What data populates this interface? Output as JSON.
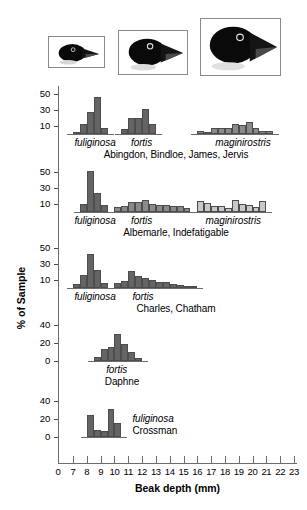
{
  "figure": {
    "y_axis_caption": "% of Sample",
    "x_axis_caption": "Beak depth (mm)",
    "x_tick_labels": [
      "0",
      "7",
      "8",
      "9",
      "10",
      "11",
      "12",
      "13",
      "14",
      "15",
      "16",
      "17",
      "18",
      "19",
      "20",
      "21",
      "22",
      "23"
    ],
    "bird_images": [
      {
        "name": "small-ground-finch-head",
        "alt": "Geospiza fuliginosa head"
      },
      {
        "name": "medium-ground-finch-head",
        "alt": "Geospiza fortis head"
      },
      {
        "name": "large-ground-finch-head",
        "alt": "Geospiza magnirostris head"
      }
    ]
  },
  "chart_data": {
    "type": "bar",
    "title": "",
    "xlabel": "Beak depth (mm)",
    "ylabel": "% of Sample",
    "xlim": [
      6.0,
      23.5
    ],
    "grid": false,
    "legend": false,
    "note": "Five stacked histogram panels of Galapagos ground finch beak depth by island group. Bin width 0.5 mm; x values are bin left edges.",
    "panels": [
      {
        "island": "Abingdon, Bindloe, James, Jervis",
        "ylim": [
          0,
          58
        ],
        "yticks": [
          10,
          30,
          50
        ],
        "species": [
          {
            "name": "fuliginosa",
            "label_x": 7.1,
            "shade": "dark",
            "bins": [
              {
                "x": 7.0,
                "v": 3
              },
              {
                "x": 7.5,
                "v": 13
              },
              {
                "x": 8.0,
                "v": 28
              },
              {
                "x": 8.5,
                "v": 47
              },
              {
                "x": 9.0,
                "v": 8
              }
            ]
          },
          {
            "name": "fortis",
            "label_x": 11.2,
            "shade": "dark",
            "bins": [
              {
                "x": 10.5,
                "v": 6
              },
              {
                "x": 11.0,
                "v": 20
              },
              {
                "x": 11.5,
                "v": 20
              },
              {
                "x": 12.0,
                "v": 31
              },
              {
                "x": 12.5,
                "v": 12
              }
            ]
          },
          {
            "name": "maginirostris",
            "label_x": 17.3,
            "shade": "mid",
            "bins": [
              {
                "x": 16.0,
                "v": 4
              },
              {
                "x": 16.5,
                "v": 2
              },
              {
                "x": 17.0,
                "v": 7
              },
              {
                "x": 17.5,
                "v": 8
              },
              {
                "x": 18.0,
                "v": 8
              },
              {
                "x": 18.5,
                "v": 12
              },
              {
                "x": 19.0,
                "v": 11
              },
              {
                "x": 19.5,
                "v": 15
              },
              {
                "x": 20.0,
                "v": 7
              },
              {
                "x": 20.5,
                "v": 4
              },
              {
                "x": 21.0,
                "v": 4
              }
            ]
          }
        ]
      },
      {
        "island": "Albemarle, Indefatigable",
        "ylim": [
          0,
          58
        ],
        "yticks": [
          10,
          30,
          50
        ],
        "species": [
          {
            "name": "fuliginosa",
            "label_x": 7.1,
            "shade": "dark",
            "bins": [
              {
                "x": 7.5,
                "v": 10
              },
              {
                "x": 8.0,
                "v": 52
              },
              {
                "x": 8.5,
                "v": 24
              },
              {
                "x": 9.0,
                "v": 9
              }
            ]
          },
          {
            "name": "fortis",
            "label_x": 11.2,
            "shade": "mid",
            "bins": [
              {
                "x": 10.0,
                "v": 6
              },
              {
                "x": 10.5,
                "v": 8
              },
              {
                "x": 11.0,
                "v": 12
              },
              {
                "x": 11.5,
                "v": 12
              },
              {
                "x": 12.0,
                "v": 15
              },
              {
                "x": 12.5,
                "v": 10
              },
              {
                "x": 13.0,
                "v": 9
              },
              {
                "x": 13.5,
                "v": 9
              },
              {
                "x": 14.0,
                "v": 7
              },
              {
                "x": 14.5,
                "v": 7
              },
              {
                "x": 15.0,
                "v": 5
              }
            ]
          },
          {
            "name": "maginirostris",
            "label_x": 16.6,
            "shade": "light",
            "bins": [
              {
                "x": 16.0,
                "v": 14
              },
              {
                "x": 16.5,
                "v": 11
              },
              {
                "x": 17.0,
                "v": 7
              },
              {
                "x": 17.5,
                "v": 8
              },
              {
                "x": 18.0,
                "v": 5
              },
              {
                "x": 18.5,
                "v": 15
              },
              {
                "x": 19.0,
                "v": 10
              },
              {
                "x": 19.5,
                "v": 9
              },
              {
                "x": 20.0,
                "v": 6
              },
              {
                "x": 20.5,
                "v": 14
              }
            ]
          }
        ]
      },
      {
        "island": "Charles, Chatham",
        "ylim": [
          0,
          58
        ],
        "yticks": [
          10,
          30,
          50
        ],
        "species": [
          {
            "name": "fuliginosa",
            "label_x": 7.1,
            "shade": "dark",
            "bins": [
              {
                "x": 7.0,
                "v": 5
              },
              {
                "x": 7.5,
                "v": 16
              },
              {
                "x": 8.0,
                "v": 43
              },
              {
                "x": 8.5,
                "v": 23
              },
              {
                "x": 9.0,
                "v": 6
              }
            ]
          },
          {
            "name": "fortis",
            "label_x": 11.3,
            "shade": "dark",
            "bins": [
              {
                "x": 10.0,
                "v": 6
              },
              {
                "x": 10.5,
                "v": 9
              },
              {
                "x": 11.0,
                "v": 22
              },
              {
                "x": 11.5,
                "v": 15
              },
              {
                "x": 12.0,
                "v": 12
              },
              {
                "x": 12.5,
                "v": 10
              },
              {
                "x": 13.0,
                "v": 8
              },
              {
                "x": 13.5,
                "v": 7
              },
              {
                "x": 14.0,
                "v": 5
              },
              {
                "x": 14.5,
                "v": 4
              },
              {
                "x": 15.0,
                "v": 2
              },
              {
                "x": 15.5,
                "v": 2
              }
            ]
          }
        ]
      },
      {
        "island": "Daphne",
        "ylim": [
          0,
          45
        ],
        "yticks": [
          0,
          20,
          40
        ],
        "species": [
          {
            "name": "fortis",
            "label_x": 9.4,
            "shade": "dark",
            "bins": [
              {
                "x": 8.5,
                "v": 4
              },
              {
                "x": 9.0,
                "v": 13
              },
              {
                "x": 9.5,
                "v": 16
              },
              {
                "x": 10.0,
                "v": 30
              },
              {
                "x": 10.5,
                "v": 19
              },
              {
                "x": 11.0,
                "v": 10
              },
              {
                "x": 11.5,
                "v": 3
              }
            ]
          }
        ]
      },
      {
        "island": "Crossman",
        "ylim": [
          0,
          45
        ],
        "yticks": [
          0,
          20,
          40
        ],
        "species": [
          {
            "name": "fuliginosa",
            "label_x": 11.3,
            "shade": "dark",
            "bins": [
              {
                "x": 8.0,
                "v": 25
              },
              {
                "x": 8.5,
                "v": 8
              },
              {
                "x": 9.0,
                "v": 7
              },
              {
                "x": 9.5,
                "v": 32
              },
              {
                "x": 10.0,
                "v": 16
              }
            ]
          }
        ]
      }
    ],
    "colors": {
      "dark": "#646464",
      "mid": "#8a8a8a",
      "light": "#c8c8c8",
      "outline": "#4d4d4d",
      "axis": "#6b6b6b"
    }
  }
}
